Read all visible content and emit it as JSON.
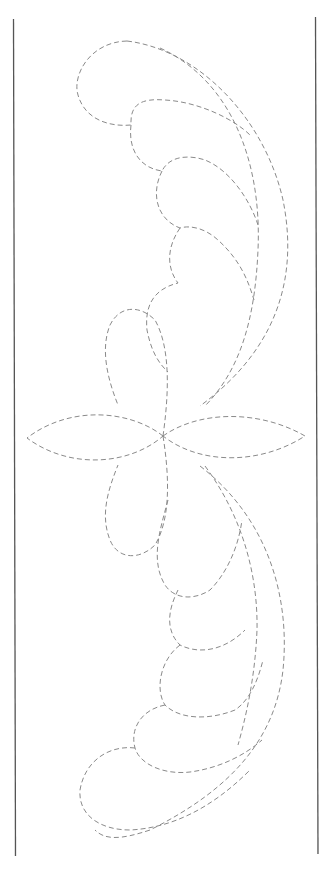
{
  "pattern": {
    "type": "quilting-stencil",
    "description": "Dashed-line feather and four-petal flower border pattern",
    "line_color": "#8a8a8a",
    "border_color": "#555555",
    "background": "#ffffff"
  }
}
